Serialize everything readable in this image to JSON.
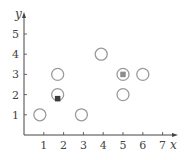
{
  "chart_data": {
    "type": "scatter",
    "title": "",
    "xlabel": "x",
    "ylabel": "y",
    "xlim": [
      0,
      7.5
    ],
    "ylim": [
      0,
      5.5
    ],
    "x_ticks": [
      1,
      2,
      3,
      4,
      5,
      6,
      7
    ],
    "y_ticks": [
      1,
      2,
      3,
      4,
      5
    ],
    "grid": false,
    "legend": null,
    "series": [
      {
        "name": "circles",
        "marker": "open-circle",
        "color": "#9a9a9a",
        "points": [
          {
            "x": 0.8,
            "y": 1
          },
          {
            "x": 1.7,
            "y": 2
          },
          {
            "x": 1.7,
            "y": 3
          },
          {
            "x": 2.9,
            "y": 1
          },
          {
            "x": 3.9,
            "y": 4
          },
          {
            "x": 5,
            "y": 3
          },
          {
            "x": 5,
            "y": 2
          },
          {
            "x": 6,
            "y": 3
          }
        ]
      },
      {
        "name": "squares",
        "marker": "filled-square",
        "points": [
          {
            "x": 1.7,
            "y": 1.8,
            "color": "#3c3c3c"
          },
          {
            "x": 5,
            "y": 3,
            "color": "#8c8c8c"
          }
        ]
      }
    ]
  },
  "colors": {
    "axis": "#444444",
    "circle_stroke": "#9a9a9a"
  }
}
